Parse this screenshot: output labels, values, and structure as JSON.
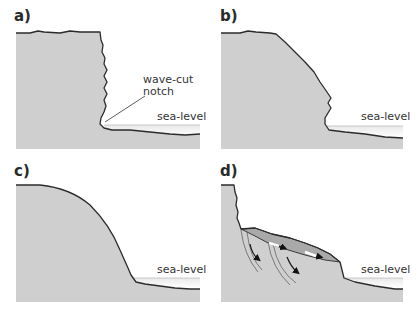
{
  "figure": {
    "colors": {
      "rock": "#cfcfcf",
      "sea": "#f4f4f4",
      "outline": "#2b2b2b",
      "slump": "#a9a9a9",
      "background": "#ffffff"
    },
    "panels": [
      {
        "id": "a",
        "label": "a)",
        "sea_label": "sea-level",
        "annotation": {
          "line1": "wave-cut",
          "line2": "notch"
        }
      },
      {
        "id": "b",
        "label": "b)",
        "sea_label": "sea-level"
      },
      {
        "id": "c",
        "label": "c)",
        "sea_label": "sea-level"
      },
      {
        "id": "d",
        "label": "d)",
        "sea_label": "sea-level"
      }
    ]
  }
}
